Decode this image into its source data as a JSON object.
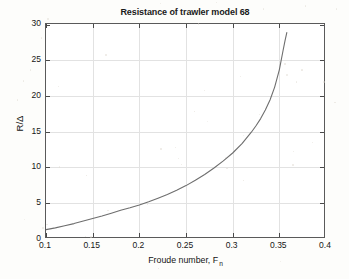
{
  "figure": {
    "title": "Resistance of trawler model 68",
    "background_color": "#fdfdfb",
    "axes_color": "#5a5a5a",
    "grid_color": "#e2e2e2",
    "curve_color": "#6e6e6e"
  },
  "axes": {
    "xlabel_text": "Froude number, F",
    "xlabel_subscript": "n",
    "ylabel": "R/Δ",
    "xticklabels": [
      "0.1",
      "0.15",
      "0.2",
      "0.25",
      "0.3",
      "0.35",
      "0.4"
    ],
    "yticklabels": [
      "0",
      "5",
      "10",
      "15",
      "20",
      "25",
      "30"
    ]
  },
  "chart_data": {
    "type": "line",
    "title": "Resistance of trawler model 68",
    "xlabel": "Froude number, F_n",
    "ylabel": "R/Δ",
    "xlim": [
      0.1,
      0.4
    ],
    "ylim": [
      0,
      30
    ],
    "xticks": [
      0.1,
      0.15,
      0.2,
      0.25,
      0.3,
      0.35,
      0.4
    ],
    "yticks": [
      0,
      5,
      10,
      15,
      20,
      25,
      30
    ],
    "grid": true,
    "legend": null,
    "series": [
      {
        "name": "R/Δ vs Froude number",
        "color": "#6e6e6e",
        "x": [
          0.1,
          0.11,
          0.12,
          0.13,
          0.14,
          0.15,
          0.16,
          0.17,
          0.18,
          0.19,
          0.2,
          0.21,
          0.22,
          0.23,
          0.24,
          0.25,
          0.26,
          0.27,
          0.28,
          0.29,
          0.3,
          0.31,
          0.32,
          0.325,
          0.33,
          0.335,
          0.34,
          0.345,
          0.35,
          0.354,
          0.356,
          0.358
        ],
        "y": [
          1.3,
          1.55,
          1.85,
          2.15,
          2.5,
          2.85,
          3.2,
          3.6,
          4.0,
          4.35,
          4.75,
          5.2,
          5.7,
          6.2,
          6.8,
          7.45,
          8.2,
          9.0,
          9.9,
          10.9,
          12.0,
          13.3,
          14.9,
          15.8,
          16.8,
          18.0,
          19.4,
          21.2,
          23.6,
          26.3,
          27.6,
          28.8
        ]
      }
    ]
  }
}
